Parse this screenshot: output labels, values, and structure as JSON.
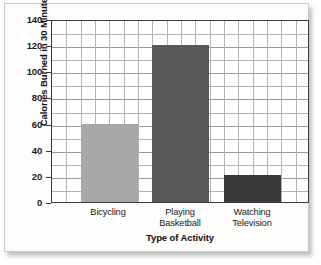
{
  "chart_data": {
    "type": "bar",
    "title": "",
    "xlabel": "Type of Activity",
    "ylabel": "Calories Burned in 30 Minutes",
    "categories": [
      "Bicycling",
      "Playing Basketball",
      "Watching Television"
    ],
    "category_lines": [
      [
        "Bicycling"
      ],
      [
        "Playing",
        "Basketball"
      ],
      [
        "Watching",
        "Television"
      ]
    ],
    "values": [
      60,
      120,
      21
    ],
    "ylim": [
      0,
      140
    ],
    "ytick_interval": 20,
    "yticks": [
      0,
      20,
      40,
      60,
      80,
      100,
      120,
      140
    ],
    "ytick_labels": [
      "0",
      "20",
      "40",
      "60",
      "80",
      "100",
      "120",
      "140"
    ],
    "minor_gridline_interval": 10,
    "grid": true,
    "grid_vertical": true,
    "vertical_gridline_count": 17,
    "legend": "none",
    "bar_colors": [
      "#a8a8a8",
      "#575757",
      "#383838"
    ],
    "bar_widths_units": [
      4,
      4,
      4
    ],
    "bar_start_units": [
      2,
      7,
      12
    ],
    "plot_border_color": "#3a3a3a",
    "gridline_color": "#b4b4b4",
    "background_color": "#ffffff",
    "frame_background": "#fbfbfa",
    "frame_border_color": "#c9c9c9",
    "text_color": "#1a1a1a"
  }
}
